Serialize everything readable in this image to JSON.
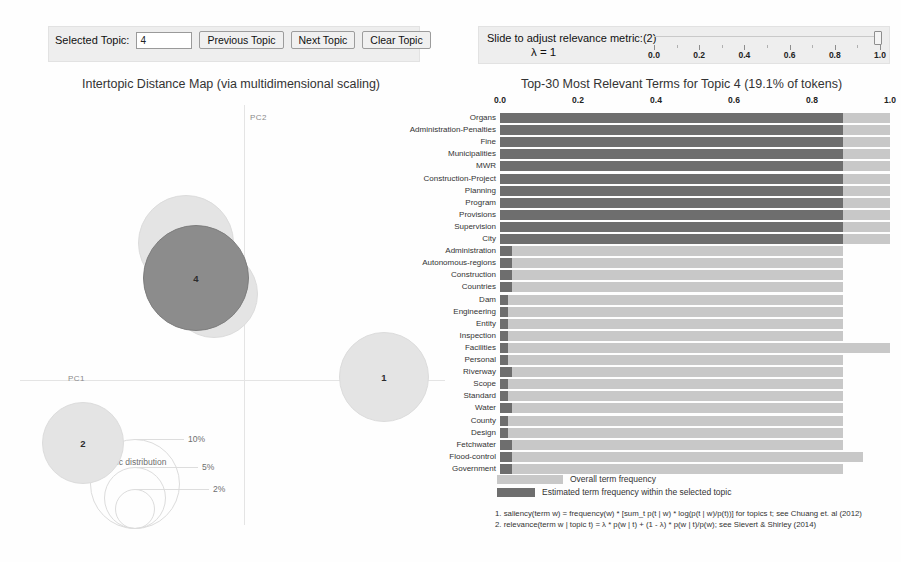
{
  "controls": {
    "selected_topic_label": "Selected Topic:",
    "selected_topic_value": "4",
    "previous_topic": "Previous Topic",
    "next_topic": "Next Topic",
    "clear_topic": "Clear Topic"
  },
  "lambda": {
    "prompt": "Slide to adjust relevance metric:(2)",
    "value_text": "λ = 1",
    "value": 1.0,
    "ticks": [
      "0.0",
      "0.2",
      "0.4",
      "0.6",
      "0.8",
      "1.0"
    ]
  },
  "map": {
    "title": "Intertopic Distance Map (via multidimensional scaling)",
    "axis_x": "PC1",
    "axis_y": "PC2",
    "marginal_caption": "Marginal topic distribution",
    "legend_sizes": [
      "2%",
      "5%",
      "10%"
    ],
    "topics": [
      {
        "id": "3",
        "cx": 186,
        "cy": 148,
        "r": 48,
        "selected": false
      },
      {
        "id": "5",
        "cx": 214,
        "cy": 199,
        "r": 44,
        "selected": false
      },
      {
        "id": "4",
        "cx": 196,
        "cy": 183,
        "r": 53,
        "selected": true
      },
      {
        "id": "1",
        "cx": 384,
        "cy": 282,
        "r": 45,
        "selected": false
      },
      {
        "id": "2",
        "cx": 83,
        "cy": 348,
        "r": 41,
        "selected": false
      }
    ]
  },
  "chart_data": {
    "type": "bar",
    "title": "Top-30 Most Relevant Terms for Topic 4 (19.1% of tokens)",
    "xlabel": "",
    "ylabel": "",
    "xlim": [
      0.0,
      1.0
    ],
    "xticks": [
      "0.0",
      "0.2",
      "0.4",
      "0.6",
      "0.8",
      "1.0"
    ],
    "grid": false,
    "legend_position": "bottom-left",
    "topic_id": 4,
    "topic_token_share": "19.1%",
    "categories": [
      "Organs",
      "Administration-Penalties",
      "Fine",
      "Municipalities",
      "MWR",
      "Construction-Project",
      "Planning",
      "Program",
      "Provisions",
      "Supervision",
      "City",
      "Administration",
      "Autonomous-regions",
      "Construction",
      "Countries",
      "Dam",
      "Engineering",
      "Entity",
      "Inspection",
      "Facilities",
      "Personal",
      "Riverway",
      "Scope",
      "Standard",
      "Water",
      "County",
      "Design",
      "Fetchwater",
      "Flood-control",
      "Government"
    ],
    "series": [
      {
        "name": "Overall term frequency",
        "color": "#c8c8c8",
        "values": [
          1.0,
          1.0,
          1.0,
          1.0,
          1.0,
          1.0,
          1.0,
          1.0,
          1.0,
          1.0,
          1.0,
          0.88,
          0.88,
          0.88,
          0.88,
          0.88,
          0.88,
          0.88,
          0.88,
          1.0,
          0.88,
          0.88,
          0.88,
          0.88,
          0.88,
          0.88,
          0.88,
          0.88,
          0.93,
          0.88
        ]
      },
      {
        "name": "Estimated term frequency within the selected topic",
        "color": "#6e6e6e",
        "values": [
          0.88,
          0.88,
          0.88,
          0.88,
          0.88,
          0.88,
          0.88,
          0.88,
          0.88,
          0.88,
          0.88,
          0.03,
          0.03,
          0.03,
          0.03,
          0.02,
          0.02,
          0.02,
          0.02,
          0.02,
          0.02,
          0.03,
          0.02,
          0.02,
          0.03,
          0.02,
          0.02,
          0.03,
          0.03,
          0.03
        ]
      }
    ]
  },
  "legend": {
    "overall": "Overall term frequency",
    "estimated": "Estimated term frequency within the selected topic"
  },
  "footnotes": [
    "1. saliency(term w) = frequency(w) * [sum_t p(t | w) * log(p(t | w)/p(t))] for topics t; see Chuang et. al (2012)",
    "2. relevance(term w | topic t) = λ * p(w | t) + (1 - λ) * p(w | t)/p(w); see Sievert & Shirley (2014)"
  ]
}
